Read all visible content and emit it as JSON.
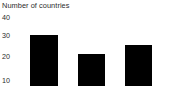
{
  "chart_data": {
    "type": "bar",
    "title": "Number of countries",
    "xlabel": "",
    "ylabel": "",
    "categories": [
      "1",
      "2",
      "3"
    ],
    "values": [
      32,
      23,
      27
    ],
    "series": [
      {
        "name": "Number of countries",
        "values": [
          32,
          23,
          27
        ]
      }
    ],
    "ytick_labels": [
      "40",
      "30",
      "20",
      "10"
    ],
    "ytick_values": [
      40,
      30,
      20,
      10
    ],
    "ylim": [
      7,
      43
    ],
    "grid": false,
    "legend": false,
    "bar_color": "#000000",
    "background_color": "#ffffff",
    "text_color": "#2b2b2b",
    "note": "chart is cropped: bars extend past the bottom edge, no axis lines rendered"
  },
  "axis": {
    "ticks": [
      {
        "label": "40",
        "value": 40
      },
      {
        "label": "30",
        "value": 30
      },
      {
        "label": "20",
        "value": 20
      },
      {
        "label": "10",
        "value": 10
      }
    ]
  },
  "bars": [
    {
      "label": "1",
      "value": 32,
      "left": 30,
      "width": 28
    },
    {
      "label": "2",
      "value": 23,
      "left": 78,
      "width": 27
    },
    {
      "label": "3",
      "value": 27,
      "left": 125,
      "width": 27
    }
  ]
}
